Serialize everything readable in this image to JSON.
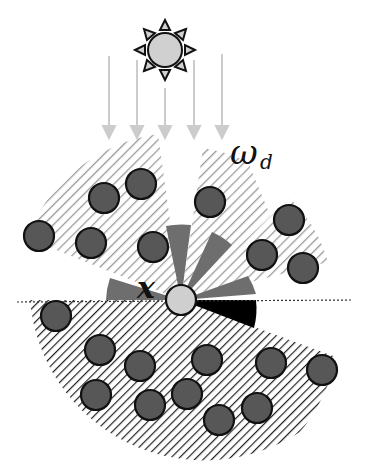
{
  "labels": {
    "direction": "ω",
    "direction_subscript": "d",
    "point": "x"
  },
  "icons": {
    "light_source": "sun-icon",
    "surface_point": "point-x-circle"
  },
  "colors": {
    "occluder": "#555555",
    "occluder_stroke": "#111111",
    "point": "#cccccc",
    "hatch": "#888888",
    "hatch_dark": "#333333",
    "wedge_mid": "#777777",
    "wedge_dark": "#000000",
    "ray": "#cccccc",
    "sun_fill": "#cfcfcf"
  }
}
